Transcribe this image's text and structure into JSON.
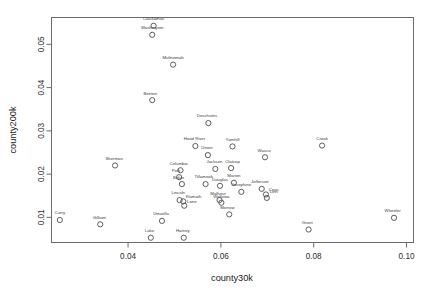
{
  "chart_data": {
    "type": "scatter",
    "title": "",
    "xlabel": "county30k",
    "ylabel": "county200k",
    "xlim": [
      0.0235,
      0.1015
    ],
    "ylim": [
      0.0042,
      0.0562
    ],
    "xticks": [
      "0.04",
      "0.06",
      "0.08",
      "0.10"
    ],
    "xtick_values": [
      0.04,
      0.06,
      0.08,
      0.1
    ],
    "yticks": [
      "0.01",
      "0.02",
      "0.03",
      "0.04",
      "0.05"
    ],
    "ytick_values": [
      0.01,
      0.02,
      0.03,
      0.04,
      0.05
    ],
    "grid": false,
    "legend": "none",
    "marker": "open-circle",
    "point_color": "#4d4d4d",
    "label_color": "#3a3a3a",
    "points": [
      {
        "label": "Clackamas",
        "x": 0.0455,
        "y": 0.0543,
        "lx": 0.0455,
        "ly": 0.0556,
        "anchor": "middle"
      },
      {
        "label": "Washington",
        "x": 0.0452,
        "y": 0.0522,
        "lx": 0.0452,
        "ly": 0.0535,
        "anchor": "middle"
      },
      {
        "label": "Multnomah",
        "x": 0.0497,
        "y": 0.0453,
        "lx": 0.0497,
        "ly": 0.0466,
        "anchor": "middle"
      },
      {
        "label": "Benton",
        "x": 0.0452,
        "y": 0.0371,
        "lx": 0.0448,
        "ly": 0.0384,
        "anchor": "middle"
      },
      {
        "label": "Deschutes",
        "x": 0.0573,
        "y": 0.0318,
        "lx": 0.057,
        "ly": 0.0331,
        "anchor": "middle"
      },
      {
        "label": "Crook",
        "x": 0.0818,
        "y": 0.0266,
        "lx": 0.0818,
        "ly": 0.0279,
        "anchor": "middle"
      },
      {
        "label": "Hood River",
        "x": 0.0545,
        "y": 0.0265,
        "lx": 0.0543,
        "ly": 0.0278,
        "anchor": "middle"
      },
      {
        "label": "Yamhill",
        "x": 0.0625,
        "y": 0.0264,
        "lx": 0.0625,
        "ly": 0.0277,
        "anchor": "middle"
      },
      {
        "label": "Union",
        "x": 0.0572,
        "y": 0.0244,
        "lx": 0.057,
        "ly": 0.0257,
        "anchor": "middle"
      },
      {
        "label": "Wasco",
        "x": 0.0695,
        "y": 0.0239,
        "lx": 0.0693,
        "ly": 0.0252,
        "anchor": "middle"
      },
      {
        "label": "Sherman",
        "x": 0.0372,
        "y": 0.022,
        "lx": 0.037,
        "ly": 0.0233,
        "anchor": "middle"
      },
      {
        "label": "Clatsop",
        "x": 0.0622,
        "y": 0.0214,
        "lx": 0.0625,
        "ly": 0.0226,
        "anchor": "middle"
      },
      {
        "label": "Jackson",
        "x": 0.0588,
        "y": 0.0212,
        "lx": 0.0586,
        "ly": 0.0225,
        "anchor": "middle"
      },
      {
        "label": "Columbia",
        "x": 0.0513,
        "y": 0.0209,
        "lx": 0.0509,
        "ly": 0.0222,
        "anchor": "middle"
      },
      {
        "label": "Polk",
        "x": 0.051,
        "y": 0.0193,
        "lx": 0.0503,
        "ly": 0.0206,
        "anchor": "middle"
      },
      {
        "label": "Baker",
        "x": 0.0516,
        "y": 0.0177,
        "lx": 0.0509,
        "ly": 0.0189,
        "anchor": "middle"
      },
      {
        "label": "Marion",
        "x": 0.0628,
        "y": 0.018,
        "lx": 0.0628,
        "ly": 0.0193,
        "anchor": "middle"
      },
      {
        "label": "Tillamook",
        "x": 0.0567,
        "y": 0.0177,
        "lx": 0.0563,
        "ly": 0.019,
        "anchor": "middle"
      },
      {
        "label": "Douglas",
        "x": 0.0598,
        "y": 0.0173,
        "lx": 0.0598,
        "ly": 0.0185,
        "anchor": "middle"
      },
      {
        "label": "Jefferson",
        "x": 0.0688,
        "y": 0.0166,
        "lx": 0.0684,
        "ly": 0.0179,
        "anchor": "middle"
      },
      {
        "label": "Josephine",
        "x": 0.0644,
        "y": 0.0159,
        "lx": 0.0644,
        "ly": 0.0172,
        "anchor": "middle"
      },
      {
        "label": "Coos",
        "x": 0.0697,
        "y": 0.0153,
        "lx": 0.0703,
        "ly": 0.0162,
        "anchor": "start"
      },
      {
        "label": "Linn",
        "x": 0.0699,
        "y": 0.0145,
        "lx": 0.0705,
        "ly": 0.0156,
        "anchor": "start"
      },
      {
        "label": "Lincoln",
        "x": 0.0511,
        "y": 0.014,
        "lx": 0.0508,
        "ly": 0.0153,
        "anchor": "middle"
      },
      {
        "label": "Klamath",
        "x": 0.0519,
        "y": 0.0137,
        "lx": 0.0524,
        "ly": 0.0144,
        "anchor": "start"
      },
      {
        "label": "Malheur",
        "x": 0.0597,
        "y": 0.014,
        "lx": 0.0594,
        "ly": 0.0152,
        "anchor": "middle"
      },
      {
        "label": "Wallowa",
        "x": 0.0601,
        "y": 0.0134,
        "lx": 0.0601,
        "ly": 0.0146,
        "anchor": "middle"
      },
      {
        "label": "Lane",
        "x": 0.0521,
        "y": 0.0127,
        "lx": 0.0527,
        "ly": 0.0134,
        "anchor": "start"
      },
      {
        "label": "Morrow",
        "x": 0.0618,
        "y": 0.0107,
        "lx": 0.0614,
        "ly": 0.0119,
        "anchor": "middle"
      },
      {
        "label": "Wheeler",
        "x": 0.0973,
        "y": 0.0099,
        "lx": 0.097,
        "ly": 0.0112,
        "anchor": "middle"
      },
      {
        "label": "Curry",
        "x": 0.0253,
        "y": 0.0094,
        "lx": 0.0253,
        "ly": 0.0107,
        "anchor": "middle"
      },
      {
        "label": "Umatilla",
        "x": 0.0473,
        "y": 0.0092,
        "lx": 0.0471,
        "ly": 0.0105,
        "anchor": "middle"
      },
      {
        "label": "Gilliam",
        "x": 0.034,
        "y": 0.0084,
        "lx": 0.0338,
        "ly": 0.0097,
        "anchor": "middle"
      },
      {
        "label": "Grant",
        "x": 0.0789,
        "y": 0.0072,
        "lx": 0.0786,
        "ly": 0.0085,
        "anchor": "middle"
      },
      {
        "label": "Lake",
        "x": 0.0449,
        "y": 0.0053,
        "lx": 0.0446,
        "ly": 0.0066,
        "anchor": "middle"
      },
      {
        "label": "Harney",
        "x": 0.052,
        "y": 0.0053,
        "lx": 0.0518,
        "ly": 0.0066,
        "anchor": "middle"
      }
    ]
  }
}
